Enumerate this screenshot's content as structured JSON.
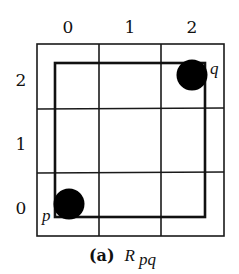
{
  "diagram": {
    "column_labels": [
      "0",
      "1",
      "2"
    ],
    "row_labels": [
      "2",
      "1",
      "0"
    ],
    "grid": {
      "cols": 3,
      "rows": 3
    },
    "points": [
      {
        "name": "q",
        "col": 2,
        "row": 2
      },
      {
        "name": "p",
        "col": 0,
        "row": 0
      }
    ],
    "caption": {
      "tag": "(a)",
      "symbol": "R",
      "subscript": "pq"
    },
    "colors": {
      "line": "#1a1a1a",
      "dot": "#000000",
      "background": "#ffffff"
    }
  }
}
